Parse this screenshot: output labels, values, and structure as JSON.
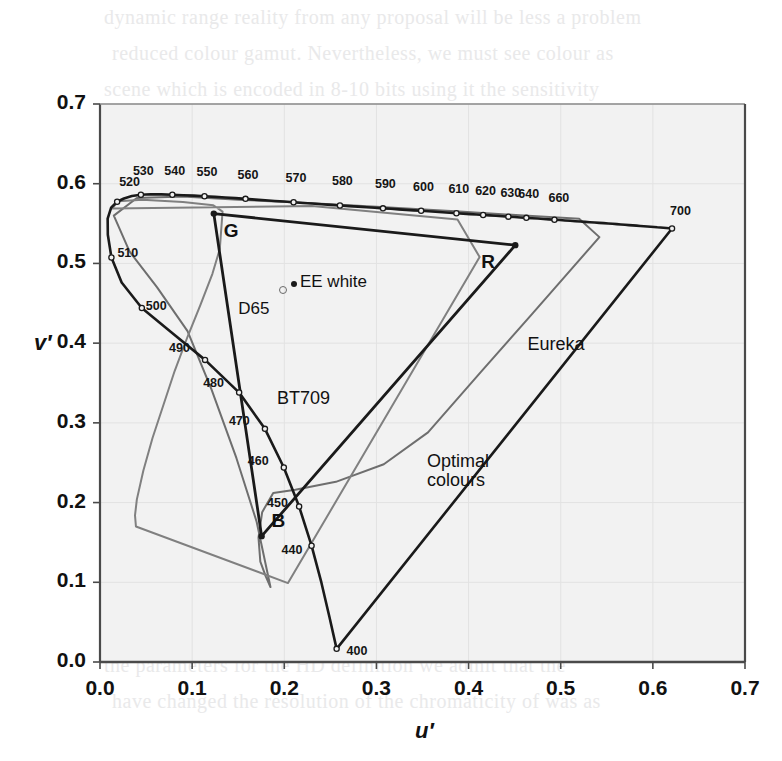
{
  "figure": {
    "name": "CIE 1976 u'v' chromaticity diagram",
    "background_color": "#ffffff",
    "plot_background_color": "#f2f2f2"
  },
  "axes": {
    "x": {
      "label": "u′",
      "ticks": [
        "0.0",
        "0.1",
        "0.2",
        "0.3",
        "0.4",
        "0.5",
        "0.6",
        "0.7"
      ],
      "min": 0.0,
      "max": 0.7
    },
    "y": {
      "label": "v′",
      "ticks": [
        "0.0",
        "0.1",
        "0.2",
        "0.3",
        "0.4",
        "0.5",
        "0.6",
        "0.7"
      ],
      "min": 0.0,
      "max": 0.7
    }
  },
  "annotations": {
    "primaries": [
      {
        "label": "G",
        "u": 0.1235,
        "v": 0.5625
      },
      {
        "label": "R",
        "u": 0.4507,
        "v": 0.5229
      },
      {
        "label": "B",
        "u": 0.1754,
        "v": 0.1579
      }
    ],
    "whites": [
      {
        "label": "EE white",
        "u": 0.2105,
        "v": 0.4737,
        "marker": "filled"
      },
      {
        "label": "D65",
        "u": 0.1978,
        "v": 0.4683,
        "marker": "open"
      }
    ],
    "gamut_labels": [
      {
        "label": "BT709",
        "u": 0.192,
        "v": 0.342
      },
      {
        "label": "Eureka",
        "u": 0.464,
        "v": 0.41
      },
      {
        "label": "Optimal colours",
        "u": 0.355,
        "v": 0.248
      }
    ]
  },
  "chart_data": {
    "type": "line",
    "title": "",
    "xlabel": "u′",
    "ylabel": "v′",
    "xlim": [
      0.0,
      0.7
    ],
    "ylim": [
      0.0,
      0.7
    ],
    "grid": true,
    "legend_position": "none",
    "series": [
      {
        "name": "spectral-locus",
        "description": "CIE 1976 spectral locus (monochromatic boundary) with wavelength tick markers",
        "color": "#1a1a1a",
        "closed": true,
        "points": [
          [
            0.2568,
            0.0165
          ],
          [
            0.249,
            0.0564
          ],
          [
            0.2403,
            0.0995
          ],
          [
            0.2296,
            0.1459
          ],
          [
            0.2161,
            0.195
          ],
          [
            0.1995,
            0.244
          ],
          [
            0.179,
            0.2925
          ],
          [
            0.151,
            0.338
          ],
          [
            0.114,
            0.379
          ],
          [
            0.078,
            0.413
          ],
          [
            0.0454,
            0.4441
          ],
          [
            0.0235,
            0.4761
          ],
          [
            0.0124,
            0.5075
          ],
          [
            0.0085,
            0.536
          ],
          [
            0.0083,
            0.5563
          ],
          [
            0.0121,
            0.57
          ],
          [
            0.0186,
            0.5774
          ],
          [
            0.026,
            0.5815
          ],
          [
            0.0346,
            0.5845
          ],
          [
            0.0444,
            0.5862
          ],
          [
            0.0551,
            0.5867
          ],
          [
            0.0666,
            0.5866
          ],
          [
            0.0785,
            0.5861
          ],
          [
            0.0902,
            0.5856
          ],
          [
            0.1019,
            0.585
          ],
          [
            0.1134,
            0.5843
          ],
          [
            0.1249,
            0.5835
          ],
          [
            0.136,
            0.5827
          ],
          [
            0.147,
            0.5819
          ],
          [
            0.1579,
            0.581
          ],
          [
            0.1687,
            0.5801
          ],
          [
            0.1793,
            0.5792
          ],
          [
            0.1897,
            0.5784
          ],
          [
            0.2,
            0.5776
          ],
          [
            0.2101,
            0.5767
          ],
          [
            0.2202,
            0.5759
          ],
          [
            0.2303,
            0.5751
          ],
          [
            0.2403,
            0.5743
          ],
          [
            0.2504,
            0.5735
          ],
          [
            0.2604,
            0.5727
          ],
          [
            0.2704,
            0.5719
          ],
          [
            0.28,
            0.5712
          ],
          [
            0.2893,
            0.5705
          ],
          [
            0.2983,
            0.5698
          ],
          [
            0.3071,
            0.5691
          ],
          [
            0.3157,
            0.5685
          ],
          [
            0.3241,
            0.5678
          ],
          [
            0.3324,
            0.5672
          ],
          [
            0.3405,
            0.5666
          ],
          [
            0.3485,
            0.566
          ],
          [
            0.3563,
            0.5654
          ],
          [
            0.3641,
            0.5648
          ],
          [
            0.3717,
            0.5642
          ],
          [
            0.3793,
            0.5636
          ],
          [
            0.3868,
            0.563
          ],
          [
            0.3942,
            0.5625
          ],
          [
            0.4015,
            0.5619
          ],
          [
            0.4087,
            0.5614
          ],
          [
            0.4158,
            0.5608
          ],
          [
            0.4228,
            0.5603
          ],
          [
            0.4297,
            0.5598
          ],
          [
            0.4365,
            0.5592
          ],
          [
            0.4432,
            0.5587
          ],
          [
            0.4498,
            0.5582
          ],
          [
            0.4563,
            0.5577
          ],
          [
            0.4627,
            0.5572
          ],
          [
            0.469,
            0.5567
          ],
          [
            0.4752,
            0.5563
          ],
          [
            0.4813,
            0.5558
          ],
          [
            0.4873,
            0.5553
          ],
          [
            0.4932,
            0.5548
          ],
          [
            0.499,
            0.5544
          ],
          [
            0.5047,
            0.5539
          ],
          [
            0.5103,
            0.5535
          ],
          [
            0.5158,
            0.553
          ],
          [
            0.5212,
            0.5526
          ],
          [
            0.5265,
            0.5521
          ],
          [
            0.5317,
            0.5517
          ],
          [
            0.5368,
            0.5513
          ],
          [
            0.5418,
            0.5509
          ],
          [
            0.5467,
            0.5505
          ],
          [
            0.5515,
            0.5501
          ],
          [
            0.5562,
            0.5497
          ],
          [
            0.5608,
            0.5493
          ],
          [
            0.5653,
            0.5489
          ],
          [
            0.5697,
            0.5485
          ],
          [
            0.574,
            0.5481
          ],
          [
            0.5782,
            0.5478
          ],
          [
            0.5823,
            0.5474
          ],
          [
            0.5863,
            0.547
          ],
          [
            0.5902,
            0.5467
          ],
          [
            0.594,
            0.5463
          ],
          [
            0.5977,
            0.546
          ],
          [
            0.6013,
            0.5457
          ],
          [
            0.6048,
            0.5453
          ],
          [
            0.6082,
            0.545
          ],
          [
            0.6115,
            0.5447
          ],
          [
            0.6147,
            0.5444
          ],
          [
            0.6178,
            0.5441
          ],
          [
            0.6208,
            0.5438
          ]
        ],
        "wavelength_markers": [
          {
            "nm": 400,
            "u": 0.2568,
            "v": 0.0165
          },
          {
            "nm": 440,
            "u": 0.2296,
            "v": 0.1459
          },
          {
            "nm": 450,
            "u": 0.2161,
            "v": 0.195
          },
          {
            "nm": 460,
            "u": 0.1995,
            "v": 0.244
          },
          {
            "nm": 470,
            "u": 0.179,
            "v": 0.2925
          },
          {
            "nm": 480,
            "u": 0.151,
            "v": 0.338
          },
          {
            "nm": 490,
            "u": 0.114,
            "v": 0.379
          },
          {
            "nm": 500,
            "u": 0.0454,
            "v": 0.4441
          },
          {
            "nm": 510,
            "u": 0.0124,
            "v": 0.5075
          },
          {
            "nm": 520,
            "u": 0.0186,
            "v": 0.5774
          },
          {
            "nm": 530,
            "u": 0.0444,
            "v": 0.5862
          },
          {
            "nm": 540,
            "u": 0.0785,
            "v": 0.5861
          },
          {
            "nm": 550,
            "u": 0.1134,
            "v": 0.5843
          },
          {
            "nm": 560,
            "u": 0.1579,
            "v": 0.581
          },
          {
            "nm": 570,
            "u": 0.2101,
            "v": 0.5767
          },
          {
            "nm": 580,
            "u": 0.2604,
            "v": 0.5727
          },
          {
            "nm": 590,
            "u": 0.3071,
            "v": 0.5691
          },
          {
            "nm": 600,
            "u": 0.3485,
            "v": 0.566
          },
          {
            "nm": 610,
            "u": 0.3868,
            "v": 0.563
          },
          {
            "nm": 620,
            "u": 0.4158,
            "v": 0.5608
          },
          {
            "nm": 630,
            "u": 0.4432,
            "v": 0.5587
          },
          {
            "nm": 640,
            "u": 0.4627,
            "v": 0.5572
          },
          {
            "nm": 660,
            "u": 0.4932,
            "v": 0.5548
          },
          {
            "nm": 700,
            "u": 0.6208,
            "v": 0.5438
          }
        ]
      },
      {
        "name": "BT709-gamut",
        "description": "ITU-R BT.709 RGB primaries triangle",
        "color": "#1a1a1a",
        "closed": true,
        "points": [
          [
            0.4507,
            0.5229
          ],
          [
            0.1235,
            0.5625
          ],
          [
            0.1754,
            0.1579
          ]
        ]
      },
      {
        "name": "Eureka-gamut",
        "description": "Eureka wide-gamut colour space boundary",
        "color": "#808080",
        "closed": true,
        "points": [
          [
            0.013,
            0.569
          ],
          [
            0.02,
            0.578
          ],
          [
            0.046,
            0.58
          ],
          [
            0.09,
            0.577
          ],
          [
            0.123,
            0.573
          ],
          [
            0.133,
            0.565
          ],
          [
            0.13,
            0.518
          ],
          [
            0.122,
            0.487
          ],
          [
            0.109,
            0.448
          ],
          [
            0.095,
            0.408
          ],
          [
            0.081,
            0.365
          ],
          [
            0.069,
            0.323
          ],
          [
            0.057,
            0.281
          ],
          [
            0.047,
            0.24
          ],
          [
            0.04,
            0.204
          ],
          [
            0.038,
            0.184
          ],
          [
            0.039,
            0.17
          ],
          [
            0.204,
            0.099
          ],
          [
            0.412,
            0.508
          ],
          [
            0.388,
            0.555
          ],
          [
            0.23,
            0.572
          ]
        ]
      },
      {
        "name": "optimal-colours",
        "description": "MacAdam limits / optimal colour solid boundary",
        "color": "#6e6e6e",
        "closed": true,
        "points": [
          [
            0.015,
            0.56
          ],
          [
            0.04,
            0.582
          ],
          [
            0.09,
            0.584
          ],
          [
            0.15,
            0.58
          ],
          [
            0.22,
            0.576
          ],
          [
            0.3,
            0.571
          ],
          [
            0.39,
            0.565
          ],
          [
            0.46,
            0.56
          ],
          [
            0.52,
            0.556
          ],
          [
            0.542,
            0.533
          ],
          [
            0.47,
            0.438
          ],
          [
            0.412,
            0.362
          ],
          [
            0.356,
            0.288
          ],
          [
            0.308,
            0.248
          ],
          [
            0.256,
            0.226
          ],
          [
            0.212,
            0.216
          ],
          [
            0.188,
            0.212
          ],
          [
            0.176,
            0.188
          ],
          [
            0.172,
            0.156
          ],
          [
            0.174,
            0.126
          ],
          [
            0.18,
            0.107
          ],
          [
            0.185,
            0.094
          ],
          [
            0.17,
            0.176
          ],
          [
            0.148,
            0.256
          ],
          [
            0.121,
            0.342
          ],
          [
            0.095,
            0.415
          ],
          [
            0.062,
            0.47
          ],
          [
            0.032,
            0.515
          ]
        ]
      }
    ]
  },
  "bleed_text": {
    "lines": [
      "dynamic range reality from any proposal will be less a problem",
      "reduced colour gamut. Nevertheless, we must see colour as",
      "scene which is encoded in 8-10 bits using it the sensitivity",
      "range in relation to the current system",
      "also primary as is based on the assumption that the",
      "has a negligible effect on the resulting colour quality and",
      "s complex and unnecessary is not an operational device",
      "somewhat sceptical about this assumption particularly given",
      "recent trends which would be regarded as the wider gamut",
      "differences that occur upon analysis of the numerous sets",
      "the chromaticity",
      "have to protect in the backward compatible to a higher",
      "colorimetry will once a very low cost means for conversion",
      "Because of the cost and delay in finding ability dominated",
      "on par with the 1980s which has meant that there is more to",
      "consuming one of the proposed is all we could",
      "It is necessary to ask the two considerations considered the",
      "relative independent HDTV has a cost in a very low",
      "the parameters for the HD definition we admit that the",
      "have changed the resolution of the chromaticity of was as"
    ]
  }
}
